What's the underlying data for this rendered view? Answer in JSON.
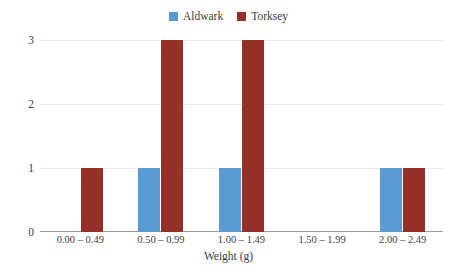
{
  "chart_data": {
    "type": "bar",
    "title": "",
    "subtitle": "",
    "xlabel": "Weight (g)",
    "ylabel": "",
    "categories": [
      "0.00 – 0.49",
      "0.50 – 0.99",
      "1.00 – 1.49",
      "1.50 – 1.99",
      "2.00 – 2.49"
    ],
    "series": [
      {
        "name": "Aldwark",
        "color": "#5B9BD5",
        "values": [
          0,
          1,
          1,
          0,
          1
        ]
      },
      {
        "name": "Torksey",
        "color": "#963128",
        "values": [
          1,
          3,
          3,
          0,
          1
        ]
      }
    ],
    "ylim": [
      0,
      3
    ],
    "yticks": [
      0,
      1,
      2,
      3
    ],
    "ytick_labels": [
      "0",
      "1",
      "2",
      "3"
    ],
    "grid": true,
    "legend_position": "top-center"
  },
  "legend": {
    "items": [
      {
        "label": "Aldwark",
        "color": "#5B9BD5"
      },
      {
        "label": "Torksey",
        "color": "#963128"
      }
    ]
  },
  "axes": {
    "y_tick_labels": [
      "3",
      "2",
      "1",
      "0"
    ],
    "x_tick_labels": [
      "0.00 – 0.49",
      "0.50 – 0.99",
      "1.00 – 1.49",
      "1.50 – 1.99",
      "2.00 – 2.49"
    ],
    "x_axis_title": "Weight (g)"
  },
  "colors": {
    "series_aldwark": "#5B9BD5",
    "series_torksey": "#963128",
    "gridline": "#E8E8E8",
    "axis": "#9A9A9A",
    "text": "#3C3C3C",
    "background": "#FFFFFF"
  }
}
